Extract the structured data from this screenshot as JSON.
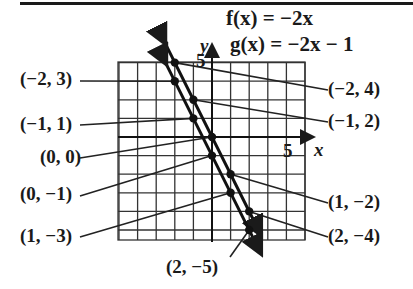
{
  "title": {
    "f_equation": "f(x) = −2x",
    "g_equation": "g(x) = −2x − 1"
  },
  "axes": {
    "x_label": "x",
    "y_label": "y",
    "x_tick_label": "5",
    "y_tick_label": "5"
  },
  "left_labels": [
    {
      "text": "(−2, 3)"
    },
    {
      "text": "(−1, 1)"
    },
    {
      "text": "(0, 0)"
    },
    {
      "text": "(0, −1)"
    },
    {
      "text": "(1, −3)"
    }
  ],
  "right_labels": [
    {
      "text": "(−2, 4)"
    },
    {
      "text": "(−1, 2)"
    },
    {
      "text": "(1, −2)"
    },
    {
      "text": "(2, −4)"
    }
  ],
  "bottom_label": {
    "text": "(2, −5)"
  },
  "graph": {
    "functions": [
      {
        "name": "f",
        "rule": "f(x) = −2x",
        "points": [
          [
            -2,
            4
          ],
          [
            -1,
            2
          ],
          [
            0,
            0
          ],
          [
            1,
            -2
          ],
          [
            2,
            -4
          ]
        ]
      },
      {
        "name": "g",
        "rule": "g(x) = −2x − 1",
        "points": [
          [
            -2,
            3
          ],
          [
            -1,
            1
          ],
          [
            0,
            -1
          ],
          [
            1,
            -3
          ],
          [
            2,
            -5
          ]
        ]
      }
    ],
    "x_range": [
      -5,
      5
    ],
    "y_range": [
      -5.5,
      4
    ],
    "grid": true
  }
}
